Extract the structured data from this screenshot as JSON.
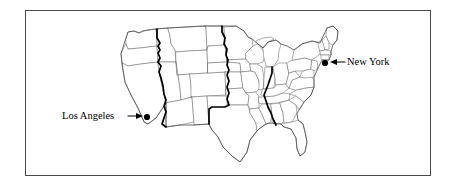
{
  "figure": {
    "background_color": "#ffffff",
    "frame": {
      "name": "figure-border",
      "color": "#4a4a4a",
      "x": 25,
      "y": 10,
      "width": 406,
      "height": 166
    }
  },
  "map": {
    "title": "",
    "region": "United States (contiguous 48 states)",
    "state_border_color": "#6d6d6d",
    "coast_outline_color": "#4d4d4d",
    "timezone_line_color": "#000000",
    "timezone_boundaries": [
      {
        "name": "pacific-mountain-boundary"
      },
      {
        "name": "mountain-central-boundary"
      },
      {
        "name": "central-eastern-boundary"
      }
    ]
  },
  "annotations": [
    {
      "id": "new-york",
      "label": "New York",
      "arrow": "←",
      "arrow_direction": "left",
      "marker_color": "#000000",
      "marker_x": 325,
      "marker_y": 63
    },
    {
      "id": "los-angeles",
      "label": "Los Angeles",
      "arrow": "→",
      "arrow_direction": "right",
      "marker_color": "#000000",
      "marker_x": 147,
      "marker_y": 117
    }
  ]
}
